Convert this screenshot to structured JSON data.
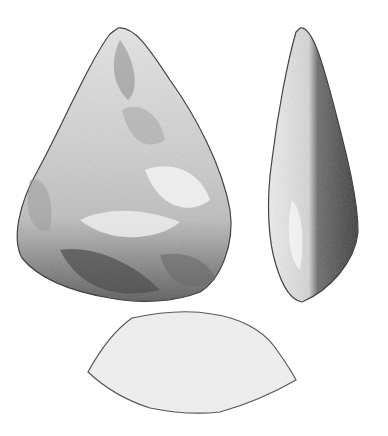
{
  "illustration": {
    "subject": "hand axe",
    "views": [
      {
        "id": "front",
        "label": ""
      },
      {
        "id": "side",
        "label": ""
      },
      {
        "id": "cross-section",
        "label": ""
      }
    ],
    "colors": {
      "background": "#ffffff",
      "ink_dark": "#2f2f2f",
      "mid_gray": "#8a8a8a",
      "light_gray": "#d9d9d9",
      "paper": "#f4f4f4"
    }
  }
}
